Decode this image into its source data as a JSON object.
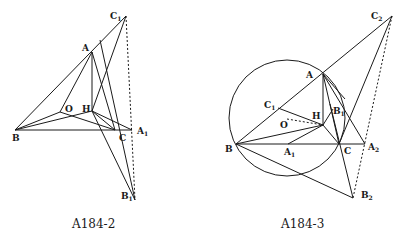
{
  "figures": [
    {
      "caption": "A184-2",
      "labels": {
        "C1": "C",
        "A": "A",
        "O": "O",
        "H": "H",
        "B": "B",
        "C": "C",
        "A1": "A",
        "B1": "B",
        "sub1": "1"
      }
    },
    {
      "caption": "A184-3",
      "labels": {
        "C2": "C",
        "A": "A",
        "C1": "C",
        "H": "H",
        "B1": "B",
        "O": "O",
        "B": "B",
        "A1": "A",
        "C": "C",
        "A2": "A",
        "B2": "B",
        "sub1": "1",
        "sub2": "2"
      }
    }
  ]
}
